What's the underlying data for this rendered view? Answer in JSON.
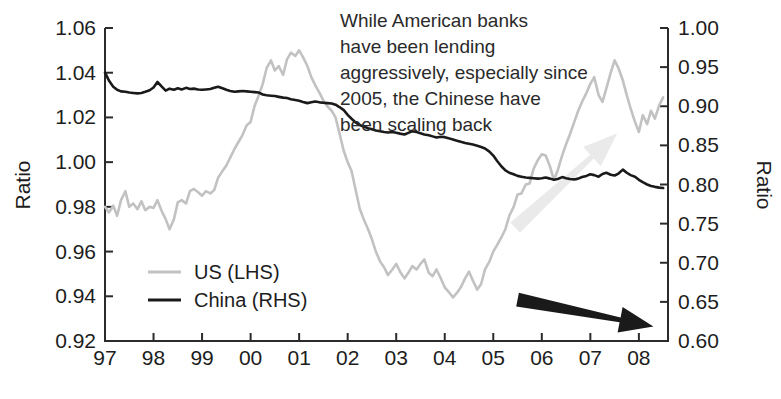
{
  "chart_data": {
    "type": "line",
    "title": "",
    "xlabel": "",
    "ylabel": "Ratio",
    "y2label": "Ratio",
    "grid": false,
    "legend_position": "inner-left-lower",
    "annotation": {
      "lines": [
        "While American banks",
        "have been lending",
        "aggressively, especially since",
        "2005, the Chinese have",
        "been scaling back"
      ]
    },
    "arrows": [
      {
        "name": "us-up-arrow",
        "color": "#d9d9d9",
        "direction": "up-right",
        "from_x": 2005.45,
        "from_y_right": 0.745,
        "to_x": 2007.55,
        "to_y_right": 0.865
      },
      {
        "name": "china-down-arrow",
        "color": "#1a1a1a",
        "direction": "down-right",
        "from_x": 2005.5,
        "from_y_left": 0.9385,
        "to_x": 2008.3,
        "to_y_left": 0.9265
      }
    ],
    "x_ticks": [
      "97",
      "98",
      "99",
      "00",
      "01",
      "02",
      "03",
      "04",
      "05",
      "06",
      "07",
      "08"
    ],
    "x_tick_values": [
      1997,
      1998,
      1999,
      2000,
      2001,
      2002,
      2003,
      2004,
      2005,
      2006,
      2007,
      2008
    ],
    "xlim": [
      1997.0,
      2008.6
    ],
    "y_ticks_left": [
      "0.92",
      "0.94",
      "0.96",
      "0.98",
      "1.00",
      "1.02",
      "1.04",
      "1.06"
    ],
    "y_tick_values_left": [
      0.92,
      0.94,
      0.96,
      0.98,
      1.0,
      1.02,
      1.04,
      1.06
    ],
    "ylim_left": [
      0.92,
      1.06
    ],
    "y_ticks_right": [
      "0.60",
      "0.65",
      "0.70",
      "0.75",
      "0.80",
      "0.85",
      "0.90",
      "0.95",
      "1.00"
    ],
    "y_tick_values_right": [
      0.6,
      0.65,
      0.7,
      0.75,
      0.8,
      0.85,
      0.9,
      0.95,
      1.0
    ],
    "ylim_right": [
      0.6,
      1.0
    ],
    "series": [
      {
        "name": "US (LHS)",
        "axis": "left",
        "color": "#c2c2c2",
        "width": 2.6,
        "x": [
          1997.0,
          1997.08,
          1997.17,
          1997.25,
          1997.33,
          1997.42,
          1997.5,
          1997.58,
          1997.67,
          1997.75,
          1997.83,
          1997.92,
          1998.0,
          1998.08,
          1998.17,
          1998.25,
          1998.33,
          1998.42,
          1998.5,
          1998.58,
          1998.67,
          1998.75,
          1998.83,
          1998.92,
          1999.0,
          1999.08,
          1999.17,
          1999.25,
          1999.33,
          1999.42,
          1999.5,
          1999.58,
          1999.67,
          1999.75,
          1999.83,
          1999.92,
          2000.0,
          2000.08,
          2000.17,
          2000.25,
          2000.33,
          2000.42,
          2000.5,
          2000.58,
          2000.67,
          2000.75,
          2000.83,
          2000.92,
          2001.0,
          2001.08,
          2001.17,
          2001.25,
          2001.33,
          2001.42,
          2001.5,
          2001.58,
          2001.67,
          2001.75,
          2001.83,
          2001.92,
          2002.0,
          2002.08,
          2002.17,
          2002.25,
          2002.33,
          2002.42,
          2002.5,
          2002.58,
          2002.67,
          2002.75,
          2002.83,
          2002.92,
          2003.0,
          2003.08,
          2003.17,
          2003.25,
          2003.33,
          2003.42,
          2003.5,
          2003.58,
          2003.67,
          2003.75,
          2003.83,
          2003.92,
          2004.0,
          2004.08,
          2004.17,
          2004.25,
          2004.33,
          2004.42,
          2004.5,
          2004.58,
          2004.67,
          2004.75,
          2004.83,
          2004.92,
          2005.0,
          2005.08,
          2005.17,
          2005.25,
          2005.33,
          2005.42,
          2005.5,
          2005.58,
          2005.67,
          2005.75,
          2005.83,
          2005.92,
          2006.0,
          2006.08,
          2006.17,
          2006.25,
          2006.33,
          2006.42,
          2006.5,
          2006.58,
          2006.67,
          2006.75,
          2006.83,
          2006.92,
          2007.0,
          2007.08,
          2007.17,
          2007.25,
          2007.33,
          2007.42,
          2007.5,
          2007.58,
          2007.67,
          2007.75,
          2007.83,
          2007.92,
          2008.0,
          2008.08,
          2008.17,
          2008.25,
          2008.33,
          2008.42,
          2008.5
        ],
        "y": [
          0.98,
          0.9775,
          0.9805,
          0.976,
          0.983,
          0.987,
          0.98,
          0.9815,
          0.979,
          0.9825,
          0.9785,
          0.98,
          0.9795,
          0.983,
          0.978,
          0.9745,
          0.97,
          0.9745,
          0.982,
          0.983,
          0.9815,
          0.987,
          0.988,
          0.9865,
          0.985,
          0.987,
          0.986,
          0.9875,
          0.993,
          0.996,
          0.9985,
          1.002,
          1.006,
          1.009,
          1.012,
          1.0165,
          1.018,
          1.025,
          1.03,
          1.035,
          1.042,
          1.0455,
          1.041,
          1.043,
          1.039,
          1.046,
          1.049,
          1.0475,
          1.05,
          1.047,
          1.043,
          1.038,
          1.0345,
          1.031,
          1.0275,
          1.025,
          1.023,
          1.02,
          1.013,
          1.005,
          1.0,
          0.996,
          0.987,
          0.979,
          0.9745,
          0.97,
          0.9655,
          0.96,
          0.9555,
          0.953,
          0.9495,
          0.952,
          0.9545,
          0.951,
          0.948,
          0.9505,
          0.9535,
          0.952,
          0.9545,
          0.9565,
          0.9505,
          0.949,
          0.952,
          0.948,
          0.944,
          0.942,
          0.9395,
          0.9415,
          0.944,
          0.948,
          0.951,
          0.947,
          0.943,
          0.9455,
          0.952,
          0.9555,
          0.96,
          0.963,
          0.9665,
          0.97,
          0.976,
          0.98,
          0.9855,
          0.986,
          0.99,
          0.9905,
          0.997,
          1.001,
          1.0035,
          1.003,
          0.998,
          0.992,
          0.9965,
          1.003,
          1.008,
          1.0125,
          1.018,
          1.023,
          1.027,
          1.031,
          1.035,
          1.038,
          1.03,
          1.027,
          1.033,
          1.04,
          1.0455,
          1.042,
          1.0365,
          1.03,
          1.024,
          1.018,
          1.0135,
          1.021,
          1.017,
          1.023,
          1.0195,
          1.0255,
          1.029
        ]
      },
      {
        "name": "China (RHS)",
        "axis": "right",
        "color": "#1a1a1a",
        "width": 2.6,
        "x": [
          1997.0,
          1997.08,
          1997.17,
          1997.25,
          1997.33,
          1997.42,
          1997.5,
          1997.58,
          1997.67,
          1997.75,
          1997.83,
          1997.92,
          1998.0,
          1998.08,
          1998.17,
          1998.25,
          1998.33,
          1998.42,
          1998.5,
          1998.58,
          1998.67,
          1998.75,
          1998.83,
          1998.92,
          1999.0,
          1999.08,
          1999.17,
          1999.25,
          1999.33,
          1999.42,
          1999.5,
          1999.58,
          1999.67,
          1999.75,
          1999.83,
          1999.92,
          2000.0,
          2000.08,
          2000.17,
          2000.25,
          2000.33,
          2000.42,
          2000.5,
          2000.58,
          2000.67,
          2000.75,
          2000.83,
          2000.92,
          2001.0,
          2001.08,
          2001.17,
          2001.25,
          2001.33,
          2001.42,
          2001.5,
          2001.58,
          2001.67,
          2001.75,
          2001.83,
          2001.92,
          2002.0,
          2002.08,
          2002.17,
          2002.25,
          2002.33,
          2002.42,
          2002.5,
          2002.58,
          2002.67,
          2002.75,
          2002.83,
          2002.92,
          2003.0,
          2003.08,
          2003.17,
          2003.25,
          2003.33,
          2003.42,
          2003.5,
          2003.58,
          2003.67,
          2003.75,
          2003.83,
          2003.92,
          2004.0,
          2004.08,
          2004.17,
          2004.25,
          2004.33,
          2004.42,
          2004.5,
          2004.58,
          2004.67,
          2004.75,
          2004.83,
          2004.92,
          2005.0,
          2005.08,
          2005.17,
          2005.25,
          2005.33,
          2005.42,
          2005.5,
          2005.58,
          2005.67,
          2005.75,
          2005.83,
          2005.92,
          2006.0,
          2006.08,
          2006.17,
          2006.25,
          2006.33,
          2006.42,
          2006.5,
          2006.58,
          2006.67,
          2006.75,
          2006.83,
          2006.92,
          2007.0,
          2007.08,
          2007.17,
          2007.25,
          2007.33,
          2007.42,
          2007.5,
          2007.58,
          2007.67,
          2007.75,
          2007.83,
          2007.92,
          2008.0,
          2008.08,
          2008.17,
          2008.25,
          2008.33,
          2008.42,
          2008.5
        ],
        "y": [
          0.943,
          0.933,
          0.925,
          0.921,
          0.919,
          0.9185,
          0.9175,
          0.917,
          0.9165,
          0.917,
          0.9185,
          0.9205,
          0.924,
          0.931,
          0.925,
          0.92,
          0.9225,
          0.921,
          0.923,
          0.9215,
          0.9235,
          0.922,
          0.9225,
          0.9215,
          0.921,
          0.9215,
          0.922,
          0.9235,
          0.925,
          0.923,
          0.921,
          0.9195,
          0.9185,
          0.919,
          0.9195,
          0.919,
          0.9185,
          0.918,
          0.9175,
          0.915,
          0.914,
          0.9135,
          0.913,
          0.912,
          0.911,
          0.9105,
          0.909,
          0.908,
          0.907,
          0.9055,
          0.904,
          0.905,
          0.906,
          0.905,
          0.9045,
          0.904,
          0.9035,
          0.902,
          0.899,
          0.895,
          0.889,
          0.884,
          0.879,
          0.876,
          0.874,
          0.872,
          0.8705,
          0.869,
          0.868,
          0.867,
          0.8665,
          0.867,
          0.866,
          0.865,
          0.864,
          0.866,
          0.868,
          0.867,
          0.8655,
          0.864,
          0.863,
          0.8615,
          0.86,
          0.861,
          0.8605,
          0.859,
          0.8575,
          0.856,
          0.8545,
          0.853,
          0.852,
          0.851,
          0.8495,
          0.848,
          0.846,
          0.842,
          0.837,
          0.83,
          0.823,
          0.818,
          0.815,
          0.813,
          0.811,
          0.81,
          0.809,
          0.8085,
          0.808,
          0.8075,
          0.808,
          0.809,
          0.8075,
          0.806,
          0.807,
          0.8095,
          0.808,
          0.807,
          0.8065,
          0.8075,
          0.8095,
          0.811,
          0.813,
          0.812,
          0.81,
          0.8135,
          0.815,
          0.8125,
          0.8115,
          0.814,
          0.819,
          0.815,
          0.812,
          0.81,
          0.806,
          0.803,
          0.8,
          0.798,
          0.797,
          0.796,
          0.7955
        ]
      }
    ]
  },
  "legend": {
    "items": [
      {
        "label": "US (LHS)",
        "color": "#c2c2c2"
      },
      {
        "label": "China (RHS)",
        "color": "#1a1a1a"
      }
    ]
  },
  "axes": {
    "left_title": "Ratio",
    "right_title": "Ratio"
  }
}
